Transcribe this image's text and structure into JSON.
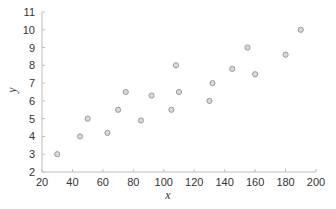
{
  "chart_data": {
    "type": "scatter",
    "title": "",
    "xlabel": "x",
    "ylabel": "y",
    "xlim": [
      20,
      200
    ],
    "ylim": [
      2,
      11
    ],
    "xticks": [
      20,
      40,
      60,
      80,
      100,
      120,
      140,
      160,
      180,
      200
    ],
    "yticks": [
      2,
      3,
      4,
      5,
      6,
      7,
      8,
      9,
      10,
      11
    ],
    "grid": false,
    "legend": null,
    "series": [
      {
        "name": "data",
        "marker": "circle",
        "marker_fill": "#d9d9d9",
        "marker_edge": "#9a9a9a",
        "points": [
          {
            "x": 30,
            "y": 3.0
          },
          {
            "x": 45,
            "y": 4.0
          },
          {
            "x": 50,
            "y": 5.0
          },
          {
            "x": 63,
            "y": 4.2
          },
          {
            "x": 70,
            "y": 5.5
          },
          {
            "x": 75,
            "y": 6.5
          },
          {
            "x": 85,
            "y": 4.9
          },
          {
            "x": 92,
            "y": 6.3
          },
          {
            "x": 105,
            "y": 5.5
          },
          {
            "x": 108,
            "y": 8.0
          },
          {
            "x": 110,
            "y": 6.5
          },
          {
            "x": 130,
            "y": 6.0
          },
          {
            "x": 132,
            "y": 7.0
          },
          {
            "x": 145,
            "y": 7.8
          },
          {
            "x": 155,
            "y": 9.0
          },
          {
            "x": 160,
            "y": 7.5
          },
          {
            "x": 180,
            "y": 8.6
          },
          {
            "x": 190,
            "y": 10.0
          }
        ]
      }
    ]
  },
  "colors": {
    "axis": "#bdbdbd",
    "tick_text": "#333333",
    "background": "#ffffff"
  }
}
